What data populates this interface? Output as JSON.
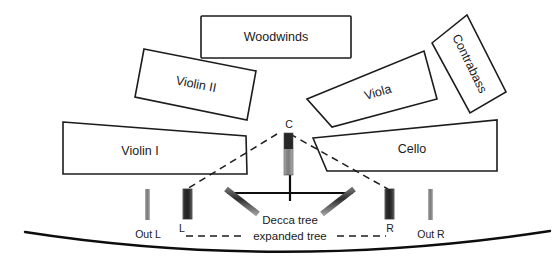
{
  "diagram": {
    "title_present": false,
    "sections": [
      {
        "id": "woodwinds",
        "label": "Woodwinds"
      },
      {
        "id": "violin2",
        "label": "Violin II"
      },
      {
        "id": "viola",
        "label": "Viola"
      },
      {
        "id": "contrabass",
        "label": "Contrabass"
      },
      {
        "id": "violin1",
        "label": "Violin I"
      },
      {
        "id": "cello",
        "label": "Cello"
      }
    ],
    "microphones": [
      {
        "id": "center",
        "label": "C",
        "type": "decca-center"
      },
      {
        "id": "left",
        "label": "L",
        "type": "decca-left"
      },
      {
        "id": "right",
        "label": "R",
        "type": "decca-right"
      },
      {
        "id": "outrigger_left",
        "label": "Out L",
        "type": "outrigger"
      },
      {
        "id": "outrigger_right",
        "label": "Out R",
        "type": "outrigger"
      }
    ],
    "annotations": [
      {
        "id": "decca_tree",
        "label": "Decca tree"
      },
      {
        "id": "expanded_tree",
        "label": "expanded tree"
      }
    ],
    "colors": {
      "line": "#1c1c1c",
      "capsule_dark": "#2b2b2b",
      "body_gray": "#8d8d8d",
      "background": "#ffffff"
    }
  }
}
